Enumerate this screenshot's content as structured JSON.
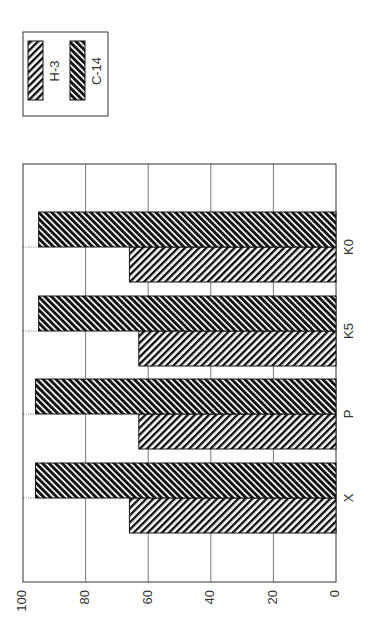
{
  "chart_data": {
    "type": "bar",
    "orientation": "vertical bars, figure rotated 90° clockwise on page",
    "title": "",
    "xlabel": "",
    "ylabel": "",
    "categories": [
      "X",
      "P",
      "K5",
      "K0"
    ],
    "series": [
      {
        "name": "H-3",
        "values": [
          66,
          63,
          63,
          66
        ],
        "pattern": "diagonal-hatch-backslash"
      },
      {
        "name": "C-14",
        "values": [
          96,
          96,
          95,
          95
        ],
        "pattern": "diagonal-hatch-forward-dense"
      }
    ],
    "ylim": [
      0,
      100
    ],
    "yticks": [
      "0",
      "20",
      "40",
      "60",
      "80",
      "100"
    ],
    "grid": true,
    "legend_position": "top (right side before rotation)"
  },
  "legend": {
    "items": [
      {
        "label": "H-3"
      },
      {
        "label": "C-14"
      }
    ]
  },
  "axis": {
    "ticks": [
      "0",
      "20",
      "40",
      "60",
      "80",
      "100"
    ]
  },
  "categories": [
    "X",
    "P",
    "K5",
    "K0"
  ],
  "colors": {
    "ink": "#111111",
    "grid": "#555555",
    "background": "#ffffff"
  }
}
